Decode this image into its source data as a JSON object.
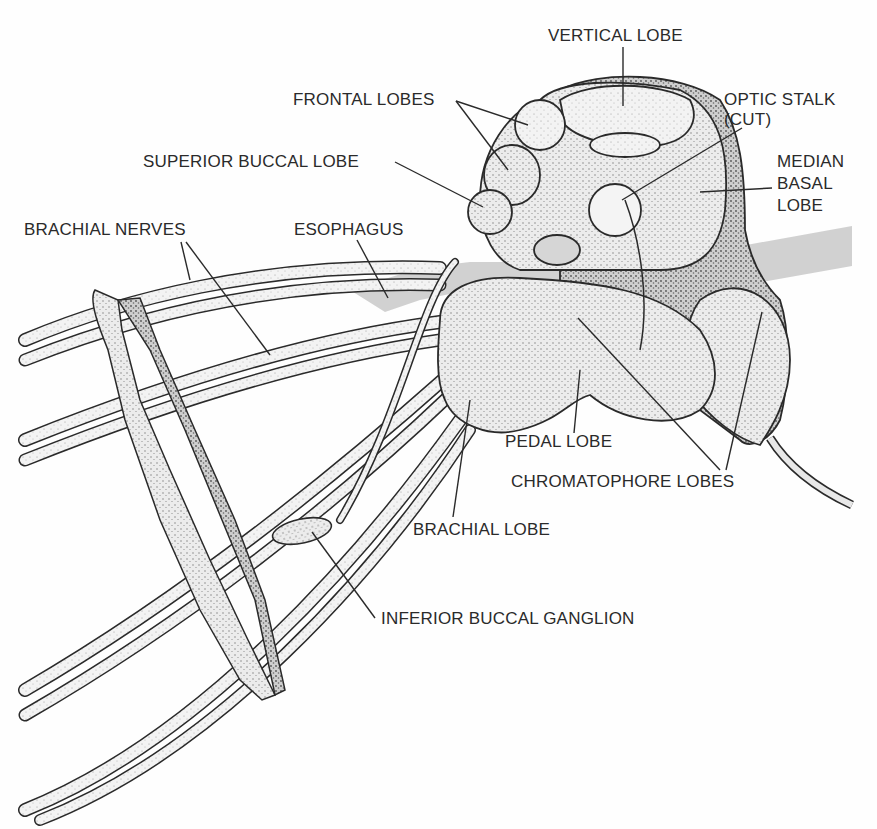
{
  "figure": {
    "colors": {
      "ink": "#2a2a2a",
      "tissue": "#e6e6e6",
      "tissue_shade": "#bdbdbd",
      "esophagus": "#c9c9c9",
      "background": "#fefefe"
    }
  },
  "labels": {
    "vertical_lobe": "VERTICAL LOBE",
    "frontal_lobes": "FRONTAL LOBES",
    "optic_stalk_line1": "OPTIC STALK",
    "optic_stalk_line2": "(CUT)",
    "superior_buccal_lobe": "SUPERIOR BUCCAL LOBE",
    "median_basal_line1": "MEDIAN",
    "median_basal_line2": "BASAL",
    "median_basal_line3": "LOBE",
    "brachial_nerves": "BRACHIAL NERVES",
    "esophagus": "ESOPHAGUS",
    "pedal_lobe": "PEDAL LOBE",
    "chromatophore_lobes": "CHROMATOPHORE LOBES",
    "brachial_lobe": "BRACHIAL LOBE",
    "inferior_buccal_ganglion": "INFERIOR BUCCAL GANGLION"
  }
}
